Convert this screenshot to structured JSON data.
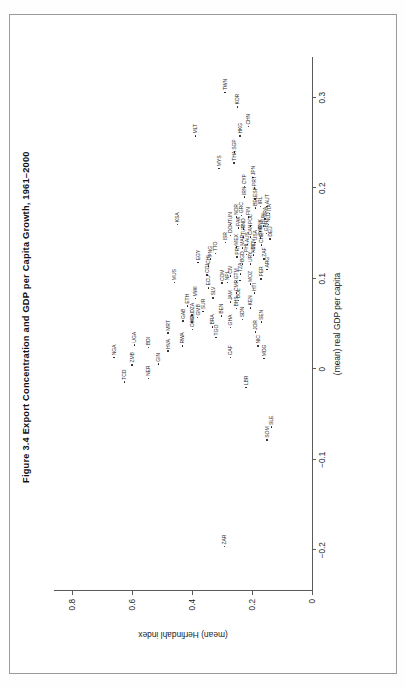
{
  "figure": {
    "title": "Figure 3.4  Export Concentration and GDP per Capita Growth, 1961–2000"
  },
  "chart_data": {
    "type": "scatter",
    "title": "Figure 3.4  Export Concentration and GDP per Capita Growth, 1961–2000",
    "xlabel": "(mean) real GDP per capita",
    "ylabel": "(mean) Herfindahl index",
    "xlim": [
      -0.245,
      0.345
    ],
    "ylim": [
      0,
      0.86
    ],
    "xticks": [
      -0.2,
      -0.1,
      0,
      0.1,
      0.2,
      0.3
    ],
    "xticklabels": [
      "−0.2",
      "−0.1",
      "0",
      "0.1",
      "0.2",
      "0.3"
    ],
    "yticks": [
      0,
      0.2,
      0.4,
      0.6,
      0.8
    ],
    "yticklabels": [
      "0",
      "0.2",
      "0.4",
      "0.6",
      "0.8"
    ],
    "grid": false,
    "legend": null,
    "point_label_field": "iso3",
    "points": [
      {
        "iso3": "TCD",
        "x": -0.014,
        "y": 0.625
      },
      {
        "iso3": "NGA",
        "x": 0.013,
        "y": 0.66
      },
      {
        "iso3": "ZMB",
        "x": 0.005,
        "y": 0.6
      },
      {
        "iso3": "UGA",
        "x": 0.027,
        "y": 0.592
      },
      {
        "iso3": "NER",
        "x": -0.01,
        "y": 0.545
      },
      {
        "iso3": "BDI",
        "x": 0.024,
        "y": 0.545
      },
      {
        "iso3": "GIN",
        "x": 0.006,
        "y": 0.512
      },
      {
        "iso3": "HVA",
        "x": 0.02,
        "y": 0.48
      },
      {
        "iso3": "MRT",
        "x": 0.04,
        "y": 0.48
      },
      {
        "iso3": "GAB",
        "x": 0.053,
        "y": 0.43
      },
      {
        "iso3": "COG",
        "x": 0.044,
        "y": 0.398
      },
      {
        "iso3": "MLI",
        "x": 0.052,
        "y": 0.4
      },
      {
        "iso3": "DZA",
        "x": 0.06,
        "y": 0.4
      },
      {
        "iso3": "GMB",
        "x": 0.057,
        "y": 0.381
      },
      {
        "iso3": "ETH",
        "x": 0.07,
        "y": 0.415
      },
      {
        "iso3": "SUR",
        "x": 0.064,
        "y": 0.364
      },
      {
        "iso3": "MWI",
        "x": 0.078,
        "y": 0.388
      },
      {
        "iso3": "RWA",
        "x": 0.026,
        "y": 0.432
      },
      {
        "iso3": "TGO",
        "x": 0.035,
        "y": 0.32
      },
      {
        "iso3": "BRA",
        "x": 0.047,
        "y": 0.332
      },
      {
        "iso3": "CAF",
        "x": 0.013,
        "y": 0.272
      },
      {
        "iso3": "LBR",
        "x": -0.02,
        "y": 0.22
      },
      {
        "iso3": "SOM",
        "x": -0.078,
        "y": 0.15
      },
      {
        "iso3": "SLE",
        "x": -0.064,
        "y": 0.135
      },
      {
        "iso3": "ZAR",
        "x": -0.196,
        "y": 0.292
      },
      {
        "iso3": "GHA",
        "x": 0.046,
        "y": 0.272
      },
      {
        "iso3": "BEN",
        "x": 0.059,
        "y": 0.302
      },
      {
        "iso3": "SLV",
        "x": 0.079,
        "y": 0.33
      },
      {
        "iso3": "ECU",
        "x": 0.09,
        "y": 0.345
      },
      {
        "iso3": "COL",
        "x": 0.104,
        "y": 0.35
      },
      {
        "iso3": "CHL",
        "x": 0.114,
        "y": 0.345
      },
      {
        "iso3": "PNG",
        "x": 0.122,
        "y": 0.338
      },
      {
        "iso3": "TTO",
        "x": 0.128,
        "y": 0.322
      },
      {
        "iso3": "SDN",
        "x": 0.055,
        "y": 0.232
      },
      {
        "iso3": "BHS",
        "x": 0.067,
        "y": 0.252
      },
      {
        "iso3": "JAM",
        "x": 0.074,
        "y": 0.272
      },
      {
        "iso3": "BOL",
        "x": 0.076,
        "y": 0.245
      },
      {
        "iso3": "CMR",
        "x": 0.084,
        "y": 0.252
      },
      {
        "iso3": "COM",
        "x": 0.095,
        "y": 0.3
      },
      {
        "iso3": "NPL",
        "x": 0.096,
        "y": 0.282
      },
      {
        "iso3": "CIV",
        "x": 0.103,
        "y": 0.272
      },
      {
        "iso3": "GTM",
        "x": 0.097,
        "y": 0.252
      },
      {
        "iso3": "MLI2",
        "x": 0.098,
        "y": 0.24
      },
      {
        "iso3": "NIC",
        "x": 0.026,
        "y": 0.18
      },
      {
        "iso3": "JOR",
        "x": 0.041,
        "y": 0.188
      },
      {
        "iso3": "MDG",
        "x": 0.012,
        "y": 0.16
      },
      {
        "iso3": "SEN",
        "x": 0.052,
        "y": 0.168
      },
      {
        "iso3": "KEN",
        "x": 0.068,
        "y": 0.205
      },
      {
        "iso3": "HTI",
        "x": 0.084,
        "y": 0.192
      },
      {
        "iso3": "MOZ",
        "x": 0.094,
        "y": 0.205
      },
      {
        "iso3": "TZA",
        "x": 0.105,
        "y": 0.238
      },
      {
        "iso3": "BGD",
        "x": 0.116,
        "y": 0.232
      },
      {
        "iso3": "PRY",
        "x": 0.124,
        "y": 0.25
      },
      {
        "iso3": "MEX",
        "x": 0.135,
        "y": 0.252
      },
      {
        "iso3": "PER",
        "x": 0.1,
        "y": 0.17
      },
      {
        "iso3": "URY",
        "x": 0.116,
        "y": 0.205
      },
      {
        "iso3": "PHL",
        "x": 0.127,
        "y": 0.218
      },
      {
        "iso3": "NZL",
        "x": 0.126,
        "y": 0.195
      },
      {
        "iso3": "ARG",
        "x": 0.11,
        "y": 0.15
      },
      {
        "iso3": "ZAF",
        "x": 0.122,
        "y": 0.16
      },
      {
        "iso3": "CHE",
        "x": 0.137,
        "y": 0.168
      },
      {
        "iso3": "SWE",
        "x": 0.145,
        "y": 0.172
      },
      {
        "iso3": "DNK",
        "x": 0.152,
        "y": 0.174
      },
      {
        "iso3": "AUS",
        "x": 0.138,
        "y": 0.215
      },
      {
        "iso3": "CAN",
        "x": 0.146,
        "y": 0.205
      },
      {
        "iso3": "USA",
        "x": 0.14,
        "y": 0.19
      },
      {
        "iso3": "GBR",
        "x": 0.15,
        "y": 0.152
      },
      {
        "iso3": "DEU",
        "x": 0.144,
        "y": 0.14
      },
      {
        "iso3": "HUN",
        "x": 0.158,
        "y": 0.162
      },
      {
        "iso3": "NLD",
        "x": 0.16,
        "y": 0.145
      },
      {
        "iso3": "FRA",
        "x": 0.166,
        "y": 0.156
      },
      {
        "iso3": "ITA",
        "x": 0.172,
        "y": 0.142
      },
      {
        "iso3": "AUT",
        "x": 0.18,
        "y": 0.15
      },
      {
        "iso3": "MAR",
        "x": 0.134,
        "y": 0.232
      },
      {
        "iso3": "TUR",
        "x": 0.146,
        "y": 0.228
      },
      {
        "iso3": "IND",
        "x": 0.155,
        "y": 0.228
      },
      {
        "iso3": "PAK",
        "x": 0.156,
        "y": 0.245
      },
      {
        "iso3": "POL",
        "x": 0.158,
        "y": 0.205
      },
      {
        "iso3": "FIN",
        "x": 0.168,
        "y": 0.212
      },
      {
        "iso3": "GRC",
        "x": 0.17,
        "y": 0.235
      },
      {
        "iso3": "NOR",
        "x": 0.168,
        "y": 0.252
      },
      {
        "iso3": "BEL",
        "x": 0.178,
        "y": 0.188
      },
      {
        "iso3": "IRL",
        "x": 0.18,
        "y": 0.172
      },
      {
        "iso3": "ISR",
        "x": 0.14,
        "y": 0.288
      },
      {
        "iso3": "TUN",
        "x": 0.16,
        "y": 0.272
      },
      {
        "iso3": "DOM",
        "x": 0.148,
        "y": 0.272
      },
      {
        "iso3": "IRN",
        "x": 0.19,
        "y": 0.225
      },
      {
        "iso3": "ESP",
        "x": 0.188,
        "y": 0.19
      },
      {
        "iso3": "PRT",
        "x": 0.2,
        "y": 0.192
      },
      {
        "iso3": "JPN",
        "x": 0.212,
        "y": 0.196
      },
      {
        "iso3": "CYP",
        "x": 0.202,
        "y": 0.225
      },
      {
        "iso3": "THA",
        "x": 0.228,
        "y": 0.26
      },
      {
        "iso3": "SGP",
        "x": 0.24,
        "y": 0.258
      },
      {
        "iso3": "MYS",
        "x": 0.222,
        "y": 0.31
      },
      {
        "iso3": "HKG",
        "x": 0.258,
        "y": 0.24
      },
      {
        "iso3": "CHN",
        "x": 0.268,
        "y": 0.212
      },
      {
        "iso3": "KOR",
        "x": 0.29,
        "y": 0.248
      },
      {
        "iso3": "TWN",
        "x": 0.306,
        "y": 0.29
      },
      {
        "iso3": "MLT",
        "x": 0.258,
        "y": 0.388
      },
      {
        "iso3": "KSA",
        "x": 0.16,
        "y": 0.448
      },
      {
        "iso3": "MUS",
        "x": 0.096,
        "y": 0.458
      },
      {
        "iso3": "EGY",
        "x": 0.118,
        "y": 0.38
      },
      {
        "iso3": "MDV",
        "x": 0.13,
        "y": 0.195
      }
    ]
  }
}
